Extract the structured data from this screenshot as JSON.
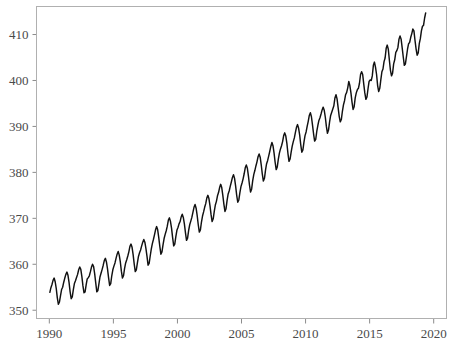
{
  "chart_data": {
    "type": "line",
    "title": "",
    "subtitle": "",
    "xlabel": "",
    "ylabel": "",
    "xlim": [
      1989.0,
      2021.0
    ],
    "ylim": [
      348.2,
      416.1
    ],
    "grid": false,
    "legend": null,
    "legend_position": "none",
    "annotations": [],
    "x_ticks": [
      1990,
      1995,
      2000,
      2005,
      2010,
      2015,
      2020
    ],
    "x_tick_labels": [
      "1990",
      "1995",
      "2000",
      "2005",
      "2010",
      "2015",
      "2020"
    ],
    "y_ticks": [
      350,
      360,
      370,
      380,
      390,
      400,
      410
    ],
    "y_tick_labels": [
      "350",
      "360",
      "370",
      "380",
      "390",
      "400",
      "410"
    ],
    "line_color": "#111111",
    "frame_color": "#b0b0b0",
    "tick_color": "#8c8c8c",
    "label_color": "#4a4a4a",
    "background_color": "#ffffff",
    "series": [
      {
        "name": "",
        "x": [
          1990.042,
          1990.125,
          1990.208,
          1990.292,
          1990.375,
          1990.458,
          1990.542,
          1990.625,
          1990.708,
          1990.792,
          1990.875,
          1990.958,
          1991.042,
          1991.125,
          1991.208,
          1991.292,
          1991.375,
          1991.458,
          1991.542,
          1991.625,
          1991.708,
          1991.792,
          1991.875,
          1991.958,
          1992.042,
          1992.125,
          1992.208,
          1992.292,
          1992.375,
          1992.458,
          1992.542,
          1992.625,
          1992.708,
          1992.792,
          1992.875,
          1992.958,
          1993.042,
          1993.125,
          1993.208,
          1993.292,
          1993.375,
          1993.458,
          1993.542,
          1993.625,
          1993.708,
          1993.792,
          1993.875,
          1993.958,
          1994.042,
          1994.125,
          1994.208,
          1994.292,
          1994.375,
          1994.458,
          1994.542,
          1994.625,
          1994.708,
          1994.792,
          1994.875,
          1994.958,
          1995.042,
          1995.125,
          1995.208,
          1995.292,
          1995.375,
          1995.458,
          1995.542,
          1995.625,
          1995.708,
          1995.792,
          1995.875,
          1995.958,
          1996.042,
          1996.125,
          1996.208,
          1996.292,
          1996.375,
          1996.458,
          1996.542,
          1996.625,
          1996.708,
          1996.792,
          1996.875,
          1996.958,
          1997.042,
          1997.125,
          1997.208,
          1997.292,
          1997.375,
          1997.458,
          1997.542,
          1997.625,
          1997.708,
          1997.792,
          1997.875,
          1997.958,
          1998.042,
          1998.125,
          1998.208,
          1998.292,
          1998.375,
          1998.458,
          1998.542,
          1998.625,
          1998.708,
          1998.792,
          1998.875,
          1998.958,
          1999.042,
          1999.125,
          1999.208,
          1999.292,
          1999.375,
          1999.458,
          1999.542,
          1999.625,
          1999.708,
          1999.792,
          1999.875,
          1999.958,
          2000.042,
          2000.125,
          2000.208,
          2000.292,
          2000.375,
          2000.458,
          2000.542,
          2000.625,
          2000.708,
          2000.792,
          2000.875,
          2000.958,
          2001.042,
          2001.125,
          2001.208,
          2001.292,
          2001.375,
          2001.458,
          2001.542,
          2001.625,
          2001.708,
          2001.792,
          2001.875,
          2001.958,
          2002.042,
          2002.125,
          2002.208,
          2002.292,
          2002.375,
          2002.458,
          2002.542,
          2002.625,
          2002.708,
          2002.792,
          2002.875,
          2002.958,
          2003.042,
          2003.125,
          2003.208,
          2003.292,
          2003.375,
          2003.458,
          2003.542,
          2003.625,
          2003.708,
          2003.792,
          2003.875,
          2003.958,
          2004.042,
          2004.125,
          2004.208,
          2004.292,
          2004.375,
          2004.458,
          2004.542,
          2004.625,
          2004.708,
          2004.792,
          2004.875,
          2004.958,
          2005.042,
          2005.125,
          2005.208,
          2005.292,
          2005.375,
          2005.458,
          2005.542,
          2005.625,
          2005.708,
          2005.792,
          2005.875,
          2005.958,
          2006.042,
          2006.125,
          2006.208,
          2006.292,
          2006.375,
          2006.458,
          2006.542,
          2006.625,
          2006.708,
          2006.792,
          2006.875,
          2006.958,
          2007.042,
          2007.125,
          2007.208,
          2007.292,
          2007.375,
          2007.458,
          2007.542,
          2007.625,
          2007.708,
          2007.792,
          2007.875,
          2007.958,
          2008.042,
          2008.125,
          2008.208,
          2008.292,
          2008.375,
          2008.458,
          2008.542,
          2008.625,
          2008.708,
          2008.792,
          2008.875,
          2008.958,
          2009.042,
          2009.125,
          2009.208,
          2009.292,
          2009.375,
          2009.458,
          2009.542,
          2009.625,
          2009.708,
          2009.792,
          2009.875,
          2009.958,
          2010.042,
          2010.125,
          2010.208,
          2010.292,
          2010.375,
          2010.458,
          2010.542,
          2010.625,
          2010.708,
          2010.792,
          2010.875,
          2010.958,
          2011.042,
          2011.125,
          2011.208,
          2011.292,
          2011.375,
          2011.458,
          2011.542,
          2011.625,
          2011.708,
          2011.792,
          2011.875,
          2011.958,
          2012.042,
          2012.125,
          2012.208,
          2012.292,
          2012.375,
          2012.458,
          2012.542,
          2012.625,
          2012.708,
          2012.792,
          2012.875,
          2012.958,
          2013.042,
          2013.125,
          2013.208,
          2013.292,
          2013.375,
          2013.458,
          2013.542,
          2013.625,
          2013.708,
          2013.792,
          2013.875,
          2013.958,
          2014.042,
          2014.125,
          2014.208,
          2014.292,
          2014.375,
          2014.458,
          2014.542,
          2014.625,
          2014.708,
          2014.792,
          2014.875,
          2014.958,
          2015.042,
          2015.125,
          2015.208,
          2015.292,
          2015.375,
          2015.458,
          2015.542,
          2015.625,
          2015.708,
          2015.792,
          2015.875,
          2015.958,
          2016.042,
          2016.125,
          2016.208,
          2016.292,
          2016.375,
          2016.458,
          2016.542,
          2016.625,
          2016.708,
          2016.792,
          2016.875,
          2016.958,
          2017.042,
          2017.125,
          2017.208,
          2017.292,
          2017.375,
          2017.458,
          2017.542,
          2017.625,
          2017.708,
          2017.792,
          2017.875,
          2017.958,
          2018.042,
          2018.125,
          2018.208,
          2018.292,
          2018.375,
          2018.458,
          2018.542,
          2018.625,
          2018.708,
          2018.792,
          2018.875,
          2018.958,
          2019.042,
          2019.125,
          2019.208,
          2019.292,
          2019.375
        ],
        "y": [
          353.9,
          354.9,
          355.6,
          356.5,
          357.0,
          356.2,
          354.7,
          352.7,
          351.3,
          351.8,
          353.2,
          354.5,
          355.0,
          356.1,
          357.0,
          357.8,
          358.3,
          357.6,
          356.0,
          354.0,
          352.5,
          352.9,
          354.5,
          355.8,
          356.4,
          357.1,
          357.8,
          358.8,
          359.4,
          358.9,
          357.3,
          355.3,
          353.8,
          354.0,
          355.5,
          356.8,
          357.1,
          357.5,
          358.4,
          359.4,
          360.0,
          359.5,
          357.9,
          355.9,
          354.0,
          354.3,
          355.8,
          357.3,
          358.1,
          358.9,
          359.8,
          360.8,
          361.3,
          360.5,
          359.0,
          357.1,
          355.4,
          355.8,
          357.5,
          358.8,
          359.6,
          360.3,
          361.3,
          362.2,
          362.8,
          362.0,
          360.5,
          358.5,
          357.0,
          357.5,
          359.1,
          360.3,
          361.0,
          361.8,
          362.7,
          363.9,
          364.4,
          363.7,
          362.1,
          360.1,
          358.4,
          358.8,
          360.3,
          361.7,
          362.5,
          363.1,
          364.0,
          364.8,
          365.4,
          364.8,
          363.4,
          361.7,
          359.8,
          360.2,
          361.8,
          363.3,
          364.5,
          365.4,
          366.4,
          367.5,
          368.2,
          367.5,
          365.8,
          363.9,
          362.2,
          362.7,
          364.2,
          365.6,
          366.5,
          367.3,
          368.3,
          369.6,
          370.1,
          369.3,
          367.8,
          365.8,
          364.0,
          364.4,
          366.0,
          367.4,
          368.0,
          368.8,
          369.3,
          370.3,
          370.9,
          370.2,
          368.8,
          366.9,
          365.2,
          365.7,
          367.4,
          368.6,
          369.4,
          370.2,
          371.3,
          372.4,
          373.0,
          372.2,
          370.6,
          368.6,
          367.0,
          367.5,
          369.2,
          370.5,
          371.4,
          372.4,
          373.2,
          374.4,
          375.0,
          374.3,
          372.7,
          370.8,
          369.3,
          369.9,
          371.5,
          372.9,
          373.7,
          374.9,
          375.6,
          376.7,
          377.4,
          376.7,
          375.0,
          373.1,
          371.5,
          372.1,
          373.9,
          375.3,
          376.0,
          377.0,
          377.9,
          378.9,
          379.5,
          378.7,
          377.0,
          375.0,
          373.5,
          374.0,
          375.6,
          376.9,
          377.7,
          378.6,
          379.7,
          381.0,
          381.6,
          380.9,
          379.2,
          377.2,
          375.7,
          376.4,
          378.2,
          379.5,
          380.4,
          381.4,
          382.3,
          383.4,
          384.0,
          383.3,
          381.6,
          379.6,
          378.1,
          378.7,
          380.5,
          381.9,
          382.6,
          383.6,
          384.6,
          385.7,
          386.5,
          385.8,
          384.2,
          382.2,
          380.6,
          381.2,
          382.9,
          384.2,
          385.1,
          385.8,
          386.7,
          388.0,
          388.6,
          387.9,
          386.3,
          384.1,
          382.4,
          382.9,
          384.4,
          385.7,
          386.7,
          387.5,
          388.7,
          389.8,
          390.4,
          389.6,
          388.1,
          386.0,
          384.4,
          384.9,
          386.6,
          388.0,
          388.8,
          390.0,
          391.1,
          392.4,
          393.0,
          392.1,
          390.3,
          388.4,
          386.8,
          387.2,
          388.9,
          390.2,
          391.3,
          391.9,
          392.7,
          393.6,
          394.2,
          393.5,
          392.0,
          390.0,
          388.5,
          389.2,
          391.0,
          392.4,
          393.1,
          393.8,
          394.5,
          396.2,
          396.9,
          396.0,
          394.1,
          392.2,
          391.0,
          391.5,
          393.3,
          394.7,
          395.6,
          396.9,
          397.4,
          398.4,
          399.8,
          398.9,
          397.3,
          395.3,
          393.7,
          394.3,
          396.2,
          397.3,
          398.0,
          398.3,
          399.4,
          401.3,
          401.9,
          401.3,
          399.2,
          397.3,
          395.9,
          396.4,
          398.2,
          399.8,
          400.1,
          400.0,
          401.0,
          403.3,
          404.0,
          402.9,
          401.3,
          398.9,
          397.6,
          398.3,
          400.2,
          401.9,
          402.5,
          404.1,
          404.9,
          407.0,
          407.7,
          406.8,
          404.4,
          402.2,
          401.0,
          401.6,
          403.6,
          404.5,
          406.1,
          406.5,
          407.2,
          409.0,
          409.7,
          409.0,
          407.1,
          405.1,
          403.3,
          403.6,
          405.2,
          406.8,
          408.0,
          408.3,
          409.4,
          410.2,
          411.2,
          410.8,
          408.7,
          406.9,
          405.5,
          406.0,
          408.0,
          409.1,
          410.8,
          411.8,
          412.0,
          413.6,
          414.7
        ]
      }
    ]
  }
}
